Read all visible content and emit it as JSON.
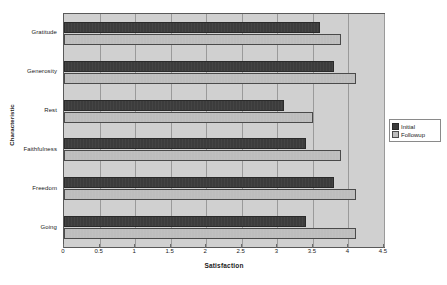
{
  "chart_data": {
    "type": "bar",
    "orientation": "horizontal",
    "title": "",
    "xlabel": "Satisfaction",
    "ylabel": "Characteristic",
    "categories": [
      "Gratitude",
      "Generosity",
      "Rest",
      "Faithfulness",
      "Freedom",
      "Going"
    ],
    "series": [
      {
        "name": "Initial",
        "values": [
          3.6,
          3.8,
          3.1,
          3.4,
          3.8,
          3.4
        ],
        "color": "#3c3c3c"
      },
      {
        "name": "Followup",
        "values": [
          3.9,
          4.1,
          3.5,
          3.9,
          4.1,
          4.1
        ],
        "color": "#bdbdbd"
      }
    ],
    "xlim": [
      0,
      4.5
    ],
    "xticks": [
      0,
      0.5,
      1,
      1.5,
      2,
      2.5,
      3,
      3.5,
      4,
      4.5
    ],
    "xtick_labels": [
      "0",
      "0.5",
      "1",
      "1.5",
      "2",
      "2.5",
      "3",
      "3.5",
      "4",
      "4.5"
    ],
    "grid": true,
    "grid_axis": "x",
    "legend_position": "right",
    "plot_background": "#d0d0d0",
    "figure_background": "#ffffff"
  }
}
